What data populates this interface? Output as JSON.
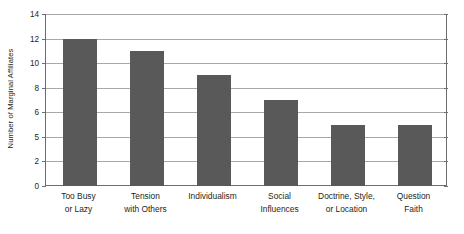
{
  "chart_data": {
    "type": "bar",
    "title": "",
    "subtitle": "",
    "xlabel": "",
    "ylabel": "Number of Marginal Affiliates",
    "categories": [
      "Too Busy or Lazy",
      "Tension with Others",
      "Individualism",
      "Social Influences",
      "Doctrine, Style, or Location",
      "Question Faith"
    ],
    "category_lines": [
      [
        "Too Busy",
        "or Lazy"
      ],
      [
        "Tension",
        "with Others"
      ],
      [
        "Individualism",
        ""
      ],
      [
        "Social",
        "Influences"
      ],
      [
        "Doctrine, Style,",
        "or Location"
      ],
      [
        "Question",
        "Faith"
      ]
    ],
    "values": [
      12,
      11,
      9,
      7,
      5,
      5
    ],
    "ylim": [
      0,
      14
    ],
    "ytick_labels": [
      "0",
      "2",
      "5",
      "6",
      "8",
      "10",
      "12",
      "14"
    ],
    "ytick_positions": [
      0,
      2,
      4,
      6,
      8,
      10,
      12,
      14
    ],
    "grid": true,
    "legend": false,
    "legend_position": "none",
    "bar_color": "#595959",
    "gridline_color": "#a8a8a8",
    "axis_color": "#6e6e6e",
    "background_color": "#ffffff",
    "text_color": "#231f20"
  }
}
